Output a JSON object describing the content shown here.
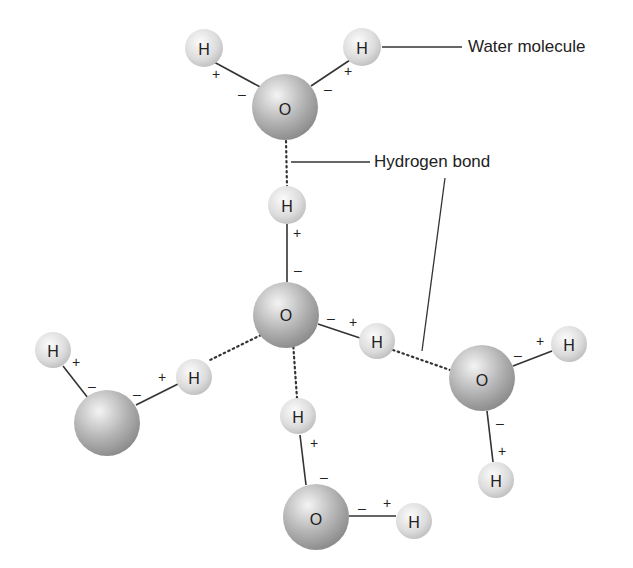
{
  "diagram": {
    "title": "",
    "callouts": {
      "water_molecule": "Water molecule",
      "hydrogen_bond": "Hydrogen bond"
    },
    "labels": {
      "oxygen": "O",
      "hydrogen": "H",
      "positive": "+",
      "negative": "–"
    },
    "colors": {
      "oxygen_light": "#f2f2f2",
      "oxygen_dark": "#8c8c8c",
      "hydrogen_light": "#fafafa",
      "hydrogen_dark": "#bdbdbd",
      "line": "#333333",
      "text": "#222222"
    },
    "molecules": [
      {
        "name": "top",
        "oxygen": {
          "x": 285,
          "y": 107,
          "label": "O"
        },
        "hydrogens": [
          {
            "x": 204,
            "y": 48
          },
          {
            "x": 362,
            "y": 47
          }
        ]
      },
      {
        "name": "center",
        "oxygen": {
          "x": 286,
          "y": 315,
          "label": "O"
        },
        "hydrogens": [
          {
            "x": 287,
            "y": 205
          },
          {
            "x": 377,
            "y": 341
          }
        ]
      },
      {
        "name": "left",
        "oxygen": {
          "x": 107,
          "y": 423,
          "label": ""
        },
        "hydrogens": [
          {
            "x": 53,
            "y": 350
          },
          {
            "x": 194,
            "y": 377
          }
        ]
      },
      {
        "name": "right",
        "oxygen": {
          "x": 482,
          "y": 378,
          "label": "O"
        },
        "hydrogens": [
          {
            "x": 569,
            "y": 344
          },
          {
            "x": 496,
            "y": 480
          }
        ]
      },
      {
        "name": "bottom",
        "oxygen": {
          "x": 316,
          "y": 517,
          "label": "O"
        },
        "hydrogens": [
          {
            "x": 298,
            "y": 416
          },
          {
            "x": 414,
            "y": 521
          }
        ]
      }
    ]
  }
}
